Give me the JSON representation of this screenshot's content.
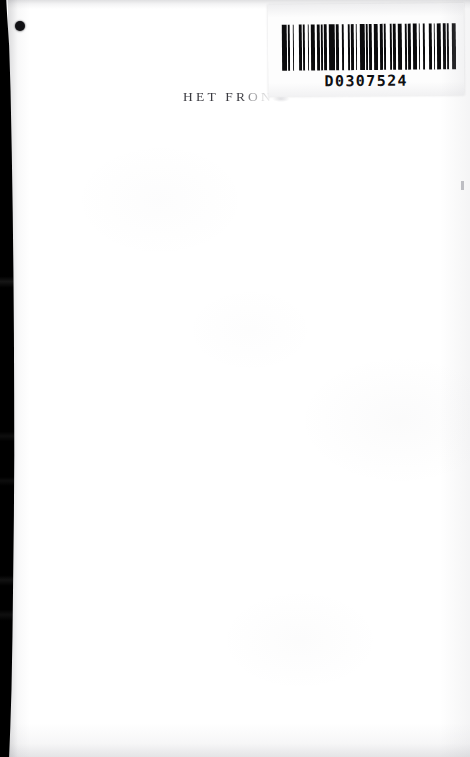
{
  "document": {
    "kind": "scanned-book-page",
    "page_background_color": "#ffffff",
    "ink_color": "#3a3a40"
  },
  "title_text": {
    "visible_text": "HET FRON",
    "note_label": "partially-occluded-title"
  },
  "barcode_sticker": {
    "number": "D0307524",
    "bar_color": "#0b0b0d",
    "sticker_color": "#fdfdfd",
    "bars": [
      3,
      1,
      1,
      2,
      1,
      3,
      2,
      1,
      1,
      2,
      1,
      1,
      3,
      1,
      2,
      1,
      1,
      1,
      2,
      1,
      4,
      1,
      2,
      2,
      1,
      3,
      1,
      1,
      2,
      1,
      1,
      2,
      3,
      1,
      1,
      1,
      2,
      1,
      3,
      1,
      2,
      1,
      1,
      3,
      1,
      1,
      2,
      1,
      3,
      2,
      1,
      1,
      2,
      1,
      3,
      1,
      1,
      2,
      1,
      3,
      2,
      1,
      1,
      1,
      3,
      1,
      2,
      1,
      1,
      2,
      3,
      1
    ]
  },
  "marks": {
    "punch_dot_label": "ink-punch-dot",
    "gutter_label": "scan-binding-shadow",
    "gutter_color": "#000000"
  }
}
